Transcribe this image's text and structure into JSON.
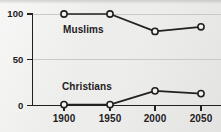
{
  "figure": {
    "background_color": "#edeeec",
    "ink_color": "#23201e",
    "gridline_color": "#c9cac6",
    "marker_fill": "#f2f2f0"
  },
  "chart_data": {
    "type": "line",
    "title": "",
    "subtitle": "",
    "xlabel": "",
    "ylabel": "",
    "x": [
      1900,
      1950,
      2000,
      2050
    ],
    "categories": [
      "1900",
      "1950",
      "2000",
      "2050"
    ],
    "xtick_labels": [
      "1900",
      "1950",
      "2000",
      "2050"
    ],
    "ytick_labels": [
      "100",
      "50",
      "0"
    ],
    "yticks": [
      100,
      50,
      0
    ],
    "xlim": [
      1875,
      2075
    ],
    "ylim": [
      0,
      100
    ],
    "grid": true,
    "grid_axis": "y",
    "legend": "inline-labels",
    "legend_position": "inline",
    "marker": "open-circle",
    "series": [
      {
        "name": "Muslims",
        "label": "Muslims",
        "values": [
          100,
          100,
          81,
          86
        ]
      },
      {
        "name": "Christians",
        "label": "Christians",
        "values": [
          1,
          1,
          16,
          13
        ]
      }
    ]
  }
}
